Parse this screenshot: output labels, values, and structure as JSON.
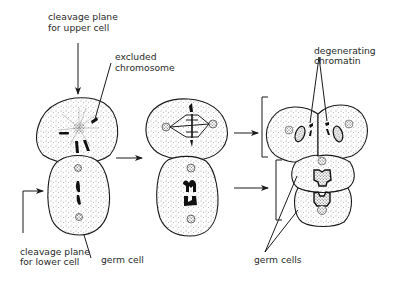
{
  "labels": {
    "cleavage_upper_line1": "cleavage plane",
    "cleavage_upper_line2": "for upper cell",
    "excluded_line1": "excluded",
    "excluded_line2": "chromosome",
    "degenerating_line1": "degenerating",
    "degenerating_line2": "chromatin",
    "cleavage_lower_line1": "cleavage plane",
    "cleavage_lower_line2": "for lower cell",
    "germ_cell": "germ cell",
    "germ_cells": "germ cells"
  },
  "stages": [
    {
      "name": "two-cell embryo with excluded chromosome",
      "position": "left"
    },
    {
      "name": "dividing two-cell embryo",
      "position": "middle"
    },
    {
      "name": "four-cell stage with degenerating chromatin",
      "position": "right"
    }
  ],
  "colors": {
    "ink": "#1a1a1a",
    "paper": "#ffffff",
    "label": "#2a2a2a"
  }
}
